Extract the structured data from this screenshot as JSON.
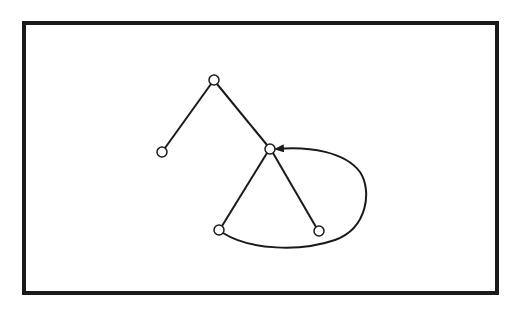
{
  "diagram": {
    "type": "tree-with-back-edge",
    "frame": {
      "x": 24,
      "y": 23,
      "width": 473,
      "height": 270,
      "stroke": "#1a1a1a",
      "stroke_width": 4
    },
    "colors": {
      "line": "#1a1a1a",
      "node_fill": "#ffffff",
      "background": "#ffffff"
    },
    "nodes": [
      {
        "id": "n1",
        "x": 214,
        "y": 80
      },
      {
        "id": "n2",
        "x": 162,
        "y": 152
      },
      {
        "id": "n3",
        "x": 270,
        "y": 149
      },
      {
        "id": "n4",
        "x": 219,
        "y": 230
      },
      {
        "id": "n5",
        "x": 319,
        "y": 231
      }
    ],
    "edges": [
      {
        "from": "n1",
        "to": "n2",
        "directed": false
      },
      {
        "from": "n1",
        "to": "n3",
        "directed": false
      },
      {
        "from": "n3",
        "to": "n4",
        "directed": false
      },
      {
        "from": "n3",
        "to": "n5",
        "directed": false
      },
      {
        "from": "n4",
        "to": "n3",
        "directed": true,
        "curved": true
      }
    ]
  }
}
